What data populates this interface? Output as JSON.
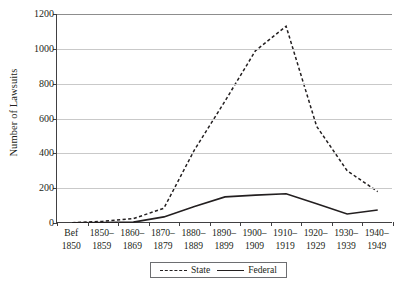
{
  "chart_data": {
    "type": "line",
    "title": "",
    "xlabel": "",
    "ylabel": "Number of Lawsuits",
    "ylim": [
      0,
      1200
    ],
    "yticks": [
      0,
      200,
      400,
      600,
      800,
      1000,
      1200
    ],
    "ytick_labels": [
      "0",
      "200",
      "400",
      "600",
      "800",
      "1000",
      "1200"
    ],
    "grid": true,
    "legend_position": "bottom-center",
    "categories": [
      "Bef 1850",
      "1850–1859",
      "1860–1869",
      "1870–1879",
      "1880–1889",
      "1890–1899",
      "1900–1909",
      "1910–1919",
      "1920–1929",
      "1930–1939",
      "1940–1949"
    ],
    "category_lines": [
      [
        "Bef",
        "1850"
      ],
      [
        "1850–",
        "1859"
      ],
      [
        "1860–",
        "1869"
      ],
      [
        "1870–",
        "1879"
      ],
      [
        "1880–",
        "1889"
      ],
      [
        "1890–",
        "1899"
      ],
      [
        "1900–",
        "1909"
      ],
      [
        "1910–",
        "1919"
      ],
      [
        "1920–",
        "1929"
      ],
      [
        "1930–",
        "1939"
      ],
      [
        "1940–",
        "1949"
      ]
    ],
    "series": [
      {
        "name": "State",
        "style": "dashed",
        "color": "#231f20",
        "values": [
          2,
          10,
          25,
          85,
          420,
          700,
          990,
          1130,
          555,
          300,
          180
        ]
      },
      {
        "name": "Federal",
        "style": "solid",
        "color": "#231f20",
        "values": [
          1,
          3,
          5,
          35,
          95,
          150,
          160,
          168,
          110,
          52,
          75
        ]
      }
    ]
  },
  "legend": {
    "entries": [
      {
        "label": "State",
        "style": "dashed"
      },
      {
        "label": "Federal",
        "style": "solid"
      }
    ]
  }
}
